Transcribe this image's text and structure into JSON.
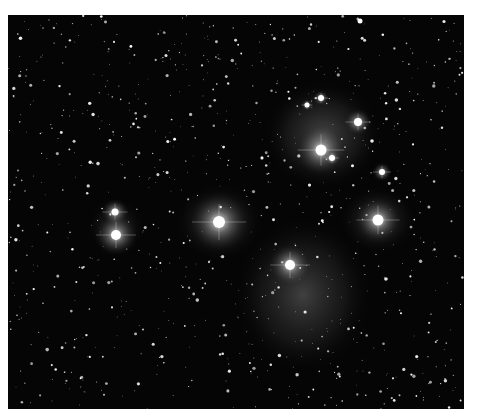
{
  "image": {
    "subject": "Pleiades star cluster with reflection nebulosity",
    "background_color": "#050505",
    "frame_color": "#ffffff",
    "bright_stars": [
      {
        "x": 352,
        "y": 6,
        "r": 2.5,
        "glow": 0
      },
      {
        "x": 107,
        "y": 197,
        "r": 3.5,
        "glow": 14
      },
      {
        "x": 108,
        "y": 220,
        "r": 5,
        "glow": 22
      },
      {
        "x": 211,
        "y": 207,
        "r": 6,
        "glow": 30
      },
      {
        "x": 313,
        "y": 83,
        "r": 3,
        "glow": 8
      },
      {
        "x": 299,
        "y": 90,
        "r": 2.5,
        "glow": 6
      },
      {
        "x": 350,
        "y": 107,
        "r": 4,
        "glow": 14
      },
      {
        "x": 313,
        "y": 135,
        "r": 5.5,
        "glow": 26
      },
      {
        "x": 324,
        "y": 143,
        "r": 3,
        "glow": 8
      },
      {
        "x": 374,
        "y": 157,
        "r": 3,
        "glow": 10
      },
      {
        "x": 370,
        "y": 205,
        "r": 5.5,
        "glow": 24
      },
      {
        "x": 282,
        "y": 250,
        "r": 5,
        "glow": 22
      }
    ],
    "nebulae": [
      {
        "cx": 315,
        "cy": 120,
        "rx": 60,
        "ry": 55,
        "opacity": 0.35
      },
      {
        "cx": 295,
        "cy": 280,
        "rx": 70,
        "ry": 80,
        "opacity": 0.32
      },
      {
        "cx": 211,
        "cy": 207,
        "rx": 45,
        "ry": 40,
        "opacity": 0.25
      },
      {
        "cx": 370,
        "cy": 205,
        "rx": 40,
        "ry": 35,
        "opacity": 0.22
      },
      {
        "cx": 108,
        "cy": 212,
        "rx": 30,
        "ry": 30,
        "opacity": 0.18
      }
    ],
    "faint_star_count": 900,
    "seed": 42
  }
}
